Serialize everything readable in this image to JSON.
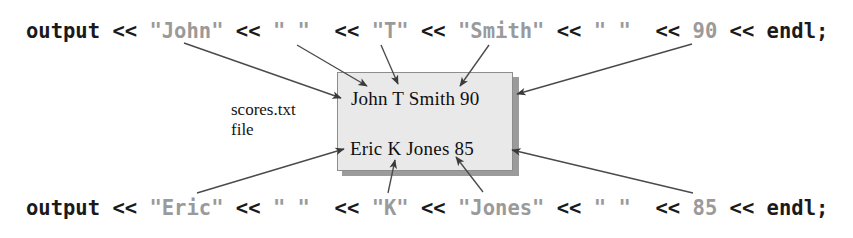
{
  "figure": {
    "background_color": "#ffffff",
    "text_color": "#1a1a1a",
    "literal_color": "#9a9a9a",
    "box_fill": "#e9e9e9",
    "box_border": "#8d8d8d",
    "box_shadow": "#9b9b9b",
    "arrow_color": "#3a3a3a"
  },
  "code": {
    "top": {
      "segments": [
        {
          "text": "output ",
          "kind": "code"
        },
        {
          "text": "<< ",
          "kind": "code"
        },
        {
          "text": "\"John\"",
          "kind": "literal"
        },
        {
          "text": " << ",
          "kind": "code"
        },
        {
          "text": "\" \"",
          "kind": "literal"
        },
        {
          "text": "  << ",
          "kind": "code"
        },
        {
          "text": "\"T\"",
          "kind": "literal"
        },
        {
          "text": " << ",
          "kind": "code"
        },
        {
          "text": "\"Smith\"",
          "kind": "literal"
        },
        {
          "text": " << ",
          "kind": "code"
        },
        {
          "text": "\" \"",
          "kind": "literal"
        },
        {
          "text": "  << ",
          "kind": "code"
        },
        {
          "text": "90",
          "kind": "literal"
        },
        {
          "text": " << endl;",
          "kind": "code"
        }
      ]
    },
    "bottom": {
      "segments": [
        {
          "text": "output ",
          "kind": "code"
        },
        {
          "text": "<< ",
          "kind": "code"
        },
        {
          "text": "\"Eric\"",
          "kind": "literal"
        },
        {
          "text": " << ",
          "kind": "code"
        },
        {
          "text": "\" \"",
          "kind": "literal"
        },
        {
          "text": "  << ",
          "kind": "code"
        },
        {
          "text": "\"K\"",
          "kind": "literal"
        },
        {
          "text": " << ",
          "kind": "code"
        },
        {
          "text": "\"Jones\"",
          "kind": "literal"
        },
        {
          "text": " << ",
          "kind": "code"
        },
        {
          "text": "\" \"",
          "kind": "literal"
        },
        {
          "text": "  << ",
          "kind": "code"
        },
        {
          "text": "85",
          "kind": "literal"
        },
        {
          "text": " << endl;",
          "kind": "code"
        }
      ]
    }
  },
  "file_box": {
    "label_line_1": "scores.txt",
    "label_line_2": "file",
    "rows": [
      "John T Smith 90",
      "Eric K Jones 85"
    ]
  },
  "arrows": [
    {
      "name": "arrow-john-to-box",
      "from": "\"John\"",
      "to": "John (record 1)"
    },
    {
      "name": "arrow-space1-to-box",
      "from": "\" \"",
      "to": "space after John"
    },
    {
      "name": "arrow-t-to-box",
      "from": "\"T\"",
      "to": "T (record 1)"
    },
    {
      "name": "arrow-smith-to-box",
      "from": "\"Smith\"",
      "to": "Smith (record 1)"
    },
    {
      "name": "arrow-90-to-box",
      "from": "90",
      "to": "90 (record 1)"
    },
    {
      "name": "arrow-eric-to-box",
      "from": "\"Eric\"",
      "to": "Eric (record 2)"
    },
    {
      "name": "arrow-k-to-box",
      "from": "\"K\"",
      "to": "K (record 2)"
    },
    {
      "name": "arrow-jones-to-box",
      "from": "\"Jones\"",
      "to": "Jones (record 2)"
    },
    {
      "name": "arrow-85-to-box",
      "from": "85",
      "to": "85 (record 2)"
    }
  ]
}
